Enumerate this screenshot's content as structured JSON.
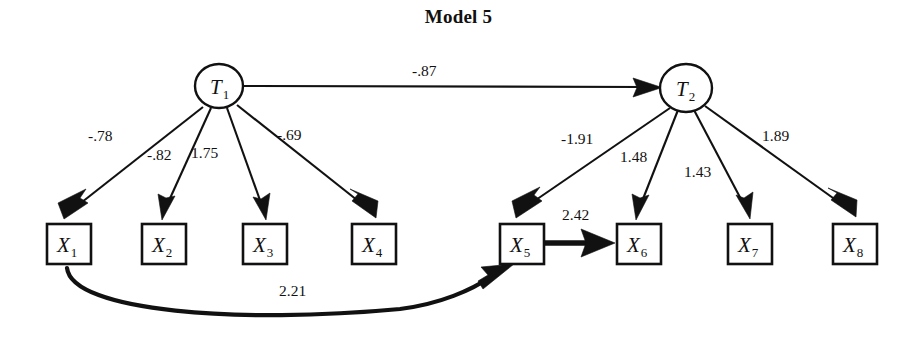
{
  "title": "Model 5",
  "diagram": {
    "type": "path-diagram",
    "latent_nodes": [
      {
        "id": "T1",
        "label": "T",
        "subscript": "1",
        "shape": "ellipse",
        "cx": 219,
        "cy": 86,
        "rx": 24,
        "ry": 22
      },
      {
        "id": "T2",
        "label": "T",
        "subscript": "2",
        "shape": "ellipse",
        "cx": 686,
        "cy": 88,
        "rx": 26,
        "ry": 24
      }
    ],
    "observed_nodes": [
      {
        "id": "X1",
        "label": "X",
        "subscript": "1",
        "shape": "box",
        "x": 47,
        "y": 224,
        "w": 44,
        "h": 40
      },
      {
        "id": "X2",
        "label": "X",
        "subscript": "2",
        "shape": "box",
        "x": 142,
        "y": 224,
        "w": 44,
        "h": 40
      },
      {
        "id": "X3",
        "label": "X",
        "subscript": "3",
        "shape": "box",
        "x": 243,
        "y": 224,
        "w": 44,
        "h": 40
      },
      {
        "id": "X4",
        "label": "X",
        "subscript": "4",
        "shape": "box",
        "x": 352,
        "y": 224,
        "w": 44,
        "h": 40
      },
      {
        "id": "X5",
        "label": "X",
        "subscript": "5",
        "shape": "box",
        "x": 500,
        "y": 224,
        "w": 44,
        "h": 40
      },
      {
        "id": "X6",
        "label": "X",
        "subscript": "6",
        "shape": "box",
        "x": 617,
        "y": 224,
        "w": 44,
        "h": 40
      },
      {
        "id": "X7",
        "label": "X",
        "subscript": "7",
        "shape": "box",
        "x": 728,
        "y": 224,
        "w": 44,
        "h": 40
      },
      {
        "id": "X8",
        "label": "X",
        "subscript": "8",
        "shape": "box",
        "x": 833,
        "y": 224,
        "w": 44,
        "h": 40
      }
    ],
    "edges": [
      {
        "id": "e-t1-t2",
        "from": "T1",
        "to": "T2",
        "coefficient": "-.87",
        "label_x": 412,
        "label_y": 63,
        "style": "straight"
      },
      {
        "id": "e-t1-x1",
        "from": "T1",
        "to": "X1",
        "coefficient": "-.78",
        "label_x": 88,
        "label_y": 128,
        "style": "straight"
      },
      {
        "id": "e-t1-x2",
        "from": "T1",
        "to": "X2",
        "coefficient": "-.82",
        "label_x": 147,
        "label_y": 147,
        "style": "straight"
      },
      {
        "id": "e-t1-x3",
        "from": "T1",
        "to": "X3",
        "coefficient": "1.75",
        "label_x": 191,
        "label_y": 145,
        "style": "straight"
      },
      {
        "id": "e-t1-x4",
        "from": "T1",
        "to": "X4",
        "coefficient": "-.69",
        "label_x": 277,
        "label_y": 127,
        "style": "straight"
      },
      {
        "id": "e-t2-x5",
        "from": "T2",
        "to": "X5",
        "coefficient": "-1.91",
        "label_x": 561,
        "label_y": 131,
        "style": "straight"
      },
      {
        "id": "e-t2-x6",
        "from": "T2",
        "to": "X6",
        "coefficient": "1.48",
        "label_x": 620,
        "label_y": 149,
        "style": "straight"
      },
      {
        "id": "e-t2-x7",
        "from": "T2",
        "to": "X7",
        "coefficient": "1.43",
        "label_x": 684,
        "label_y": 164,
        "style": "straight"
      },
      {
        "id": "e-t2-x8",
        "from": "T2",
        "to": "X8",
        "coefficient": "1.89",
        "label_x": 762,
        "label_y": 128,
        "style": "straight"
      },
      {
        "id": "e-x5-x6",
        "from": "X5",
        "to": "X6",
        "coefficient": "2.42",
        "label_x": 562,
        "label_y": 207,
        "style": "thick-straight"
      },
      {
        "id": "e-x1-x5",
        "from": "X1",
        "to": "X5",
        "coefficient": "2.21",
        "label_x": 279,
        "label_y": 283,
        "style": "thick-curve"
      }
    ],
    "colors": {
      "stroke": "#111111",
      "fill": "#ffffff",
      "text": "#111111",
      "background": "#ffffff"
    }
  }
}
